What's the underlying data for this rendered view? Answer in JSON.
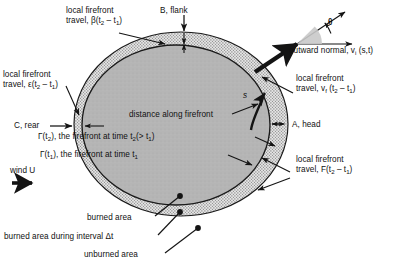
{
  "figure": {
    "type": "wildfire-firefront-propagation-diagram"
  },
  "colors": {
    "burned_area_fill": "#b3b3b3",
    "interval_band_fill": "#dcdcdc",
    "stipple_dot": "#6e6e6e",
    "unburned_background": "#ffffff",
    "outline": "#1a1a1a",
    "text": "#111111",
    "wedge_fill": "#c9c9c9"
  },
  "labels": {
    "beta_travel": {
      "line1": "local firefront",
      "line2_pre": "travel, β(t",
      "sub1": "2",
      "mid": " – t",
      "sub2": "1",
      "post": ")"
    },
    "epsilon_travel": {
      "line1": "local firefront",
      "line2_pre": "travel, ε(t",
      "sub1": "2",
      "mid": " – t",
      "sub2": "1",
      "post": ")"
    },
    "vf_travel": {
      "line1": "local firefront",
      "line2_pre": "travel, v",
      "subf": "f",
      "open": " (t",
      "sub1": "2",
      "mid": " – t",
      "sub2": "1",
      "post": ")"
    },
    "F_travel": {
      "line1": "local firefront",
      "line2_pre": "travel, F(t",
      "sub1": "2",
      "mid": " – t",
      "sub2": "1",
      "post": ")"
    },
    "b_flank": "B, flank",
    "a_head": "A, head",
    "c_rear": "C, rear",
    "theta": "θ",
    "outward_normal": {
      "pre": "outward normal, v",
      "sub": "i",
      "post": " (s,t)"
    },
    "distance_along_firefront": "distance along firefront",
    "gamma_t2": {
      "pre": "Γ(t",
      "sub1": "2",
      "mid": "), the firefront at time t",
      "sub2": "2",
      "mid2": "(> t",
      "sub3": "1",
      "post": ")"
    },
    "gamma_t1": {
      "pre": "Γ(t",
      "sub1": "1",
      "mid": "), the firefront at time t",
      "sub2": "1"
    },
    "arc_s": "s",
    "wind": "wind U",
    "burned_area": "burned area",
    "burned_area_interval": "burned area during interval Δt",
    "unburned_area": "unburned area"
  }
}
